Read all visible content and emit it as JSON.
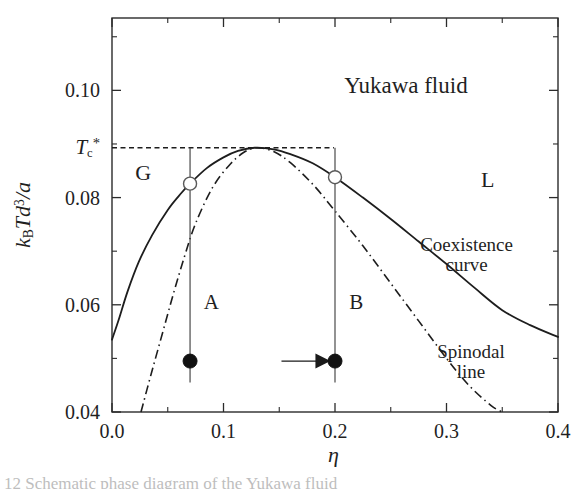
{
  "figure": {
    "title_in_plot": "Yukawa fluid",
    "caption_fragment": "12   Schematic phase diagram of the Yukawa fluid"
  },
  "axes": {
    "x": {
      "label": "η",
      "ticks": [
        "0.0",
        "0.1",
        "0.2",
        "0.3",
        "0.4"
      ],
      "tick_values": [
        0.0,
        0.1,
        0.2,
        0.3,
        0.4
      ],
      "minor_tick_values": [
        0.05,
        0.15,
        0.25,
        0.35
      ],
      "range": [
        0.0,
        0.4
      ]
    },
    "y": {
      "label_html": "k<sub>B</sub>Td<sup>3</sup>/a",
      "label_plain": "kBTd3/a",
      "ticks": [
        "0.04",
        "0.06",
        "0.08",
        "0.10"
      ],
      "tick_values": [
        0.04,
        0.06,
        0.08,
        0.1
      ],
      "minor_tick_values": [
        0.05,
        0.07,
        0.09,
        0.11
      ],
      "range": [
        0.04,
        0.1135
      ]
    }
  },
  "annotations": {
    "critical_temp_label": "T",
    "critical_temp_sub": "c",
    "critical_temp_sup": "*",
    "critical_temp_value": 0.0893,
    "region_gas": "G",
    "region_liquid": "L",
    "coexistence_label_line1": "Coexistence",
    "coexistence_label_line2": "curve",
    "spinodal_label_line1": "Spinodal",
    "spinodal_label_line2": "line",
    "state_a": "A",
    "state_b": "B"
  },
  "colors": {
    "line": "#1d1d1d",
    "frame": "#2b2b2b",
    "text": "#1f1f1f",
    "marker_fill": "#111111",
    "marker_open_fill": "#ffffff",
    "background": "#ffffff"
  },
  "chart_data": {
    "type": "line",
    "title": "Yukawa fluid",
    "xlabel": "η",
    "ylabel": "kBTd^3/a",
    "xlim": [
      0.0,
      0.4
    ],
    "ylim": [
      0.04,
      0.1135
    ],
    "grid": false,
    "legend": "in-plot labels",
    "critical_point": {
      "eta": 0.128,
      "T": 0.0893
    },
    "series": [
      {
        "name": "Coexistence curve",
        "style": "solid",
        "points": [
          [
            0.0,
            0.0535
          ],
          [
            0.006,
            0.0572
          ],
          [
            0.014,
            0.0625
          ],
          [
            0.024,
            0.068
          ],
          [
            0.036,
            0.073
          ],
          [
            0.05,
            0.0777
          ],
          [
            0.062,
            0.0808
          ],
          [
            0.07,
            0.0826
          ],
          [
            0.085,
            0.0855
          ],
          [
            0.1,
            0.0875
          ],
          [
            0.113,
            0.0887
          ],
          [
            0.128,
            0.0893
          ],
          [
            0.145,
            0.089
          ],
          [
            0.16,
            0.0881
          ],
          [
            0.18,
            0.0864
          ],
          [
            0.2,
            0.0838
          ],
          [
            0.225,
            0.08
          ],
          [
            0.25,
            0.076
          ],
          [
            0.275,
            0.0718
          ],
          [
            0.3,
            0.0676
          ],
          [
            0.325,
            0.0632
          ],
          [
            0.35,
            0.059
          ],
          [
            0.375,
            0.0562
          ],
          [
            0.4,
            0.054
          ]
        ]
      },
      {
        "name": "Spinodal line",
        "style": "dash-dot",
        "points": [
          [
            0.026,
            0.04
          ],
          [
            0.035,
            0.047
          ],
          [
            0.045,
            0.0545
          ],
          [
            0.055,
            0.062
          ],
          [
            0.065,
            0.069
          ],
          [
            0.075,
            0.0752
          ],
          [
            0.09,
            0.0818
          ],
          [
            0.105,
            0.086
          ],
          [
            0.118,
            0.0884
          ],
          [
            0.13,
            0.0893
          ],
          [
            0.145,
            0.0886
          ],
          [
            0.16,
            0.0865
          ],
          [
            0.18,
            0.0825
          ],
          [
            0.2,
            0.0775
          ],
          [
            0.225,
            0.071
          ],
          [
            0.25,
            0.064
          ],
          [
            0.275,
            0.057
          ],
          [
            0.3,
            0.05
          ],
          [
            0.32,
            0.045
          ],
          [
            0.34,
            0.0412
          ],
          [
            0.35,
            0.04
          ]
        ]
      }
    ],
    "quench_paths": [
      {
        "name": "A",
        "eta": 0.07,
        "start_T": 0.0893,
        "end_T": 0.0455,
        "initial_state_T": 0.0826,
        "final_state_T": 0.0495
      },
      {
        "name": "B",
        "eta": 0.2,
        "start_T": 0.0893,
        "end_T": 0.0455,
        "initial_state_T": 0.0838,
        "final_state_T": 0.0495
      }
    ],
    "arrow": {
      "from_eta": 0.152,
      "to_eta": 0.195,
      "T": 0.0495
    },
    "critical_isotherm_dashed": {
      "T": 0.0893,
      "from_eta": 0.0,
      "to_eta": 0.199
    }
  }
}
